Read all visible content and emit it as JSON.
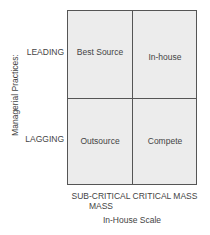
{
  "diagram": {
    "y_axis_label": "Managerial Practices:",
    "x_axis_label": "In-House Scale",
    "rows": [
      {
        "label": "LEADING"
      },
      {
        "label": "LAGGING"
      }
    ],
    "columns": [
      {
        "label": "SUB-CRITICAL MASS"
      },
      {
        "label": "CRITICAL MASS"
      }
    ],
    "cells": {
      "leading_subcritical": "Best Source",
      "leading_critical": "In-house",
      "lagging_subcritical": "Outsource",
      "lagging_critical": "Compete"
    },
    "colors": {
      "cell_fill": "#ececec",
      "lines": "#555555",
      "text": "#444444"
    }
  }
}
